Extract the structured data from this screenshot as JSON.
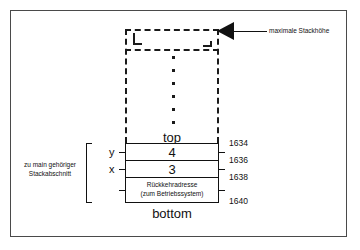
{
  "diagram": {
    "title_annotation": "maximale Stackhöhe",
    "side_annotation_line1": "zu main gehöriger",
    "side_annotation_line2": "Stackabschnitt",
    "top_caption": "top",
    "bottom_caption": "bottom",
    "variables": {
      "y": "y",
      "x": "x"
    },
    "stack_rows": [
      {
        "value": "4",
        "kind": "value"
      },
      {
        "value": "3",
        "kind": "value"
      },
      {
        "line1": "Rückkehradresse",
        "line2": "(zum Betriebssystem)",
        "kind": "return-address"
      }
    ],
    "addresses": [
      "1634",
      "1636",
      "1638",
      "1640"
    ],
    "colors": {
      "ink": "#111111",
      "frame": "#4a4a4a",
      "paper": "#ffffff"
    }
  }
}
